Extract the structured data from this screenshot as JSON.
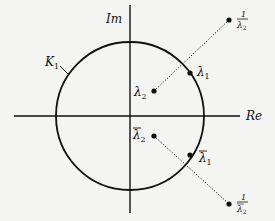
{
  "diagram": {
    "axes": {
      "real_label": "Re",
      "imag_label": "Im"
    },
    "circle": {
      "label": "K",
      "label_sub": "1"
    },
    "points": {
      "lambda1": {
        "sym": "λ",
        "sub": "1"
      },
      "lambda2": {
        "sym": "λ",
        "sub": "2"
      },
      "lambda1_conj": {
        "sym": "λ",
        "sub": "1"
      },
      "lambda2_conj": {
        "sym": "λ",
        "sub": "2"
      },
      "inv_lambda2": {
        "num": "1",
        "sym": "λ",
        "sub": "2"
      },
      "inv_lambda2_conj": {
        "num": "1",
        "sym": "λ",
        "sub": "2"
      }
    },
    "colors": {
      "ink": "#111111",
      "background": "#f4f4f2"
    }
  }
}
